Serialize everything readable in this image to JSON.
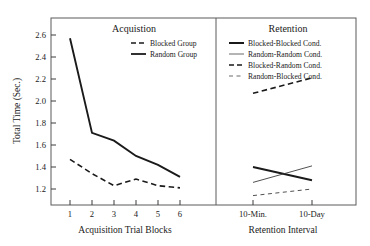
{
  "chart_data": {
    "type": "line",
    "title": "",
    "ylabel": "Total Time (Sec.)",
    "ylim": [
      1.1,
      2.7
    ],
    "ytick_labels": [
      "1.2",
      "1.4",
      "1.6",
      "1.8",
      "2.0",
      "2.2",
      "2.4",
      "2.6"
    ],
    "yticks": [
      1.2,
      1.4,
      1.6,
      1.8,
      2.0,
      2.2,
      2.4,
      2.6
    ],
    "grid": false,
    "legend_position": "top-right-of-each-panel",
    "panels": [
      {
        "name": "acquisition",
        "title": "Acquistion",
        "xlabel": "Acquisition Trial Blocks",
        "categories": [
          "1",
          "2",
          "3",
          "4",
          "5",
          "6"
        ],
        "x": [
          1,
          2,
          3,
          4,
          5,
          6
        ],
        "series": [
          {
            "name": "Blocked Group",
            "style": "dashed",
            "width": "thick",
            "color": "#1a1a1a",
            "values": [
              1.47,
              1.34,
              1.23,
              1.29,
              1.23,
              1.21
            ]
          },
          {
            "name": "Random Group",
            "style": "solid",
            "width": "thick",
            "color": "#1a1a1a",
            "values": [
              2.57,
              1.71,
              1.64,
              1.5,
              1.42,
              1.31
            ]
          }
        ]
      },
      {
        "name": "retention",
        "title": "Retention",
        "xlabel": "Retention Interval",
        "categories": [
          "10-Min.",
          "10-Day"
        ],
        "x": [
          1,
          2
        ],
        "series": [
          {
            "name": "Blocked-Blocked Cond.",
            "style": "solid",
            "width": "thick",
            "color": "#1a1a1a",
            "values": [
              1.4,
              1.28
            ]
          },
          {
            "name": "Random-Random Cond.",
            "style": "solid",
            "width": "thin",
            "color": "#3c3c3c",
            "values": [
              1.26,
              1.41
            ]
          },
          {
            "name": "Blocked-Random Cond.",
            "style": "dashed",
            "width": "thick",
            "color": "#1a1a1a",
            "values": [
              2.07,
              2.21
            ]
          },
          {
            "name": "Random-Blocked Cond.",
            "style": "dashed",
            "width": "thin",
            "color": "#3c3c3c",
            "values": [
              1.14,
              1.2
            ]
          }
        ]
      }
    ]
  },
  "axes": {
    "ylabel": "Total Time (Sec.)",
    "ytick_labels": [
      "1.2",
      "1.4",
      "1.6",
      "1.8",
      "2.0",
      "2.2",
      "2.4",
      "2.6"
    ],
    "left_xlabel": "Acquisition Trial Blocks",
    "left_xtick_labels": [
      "1",
      "2",
      "3",
      "4",
      "5",
      "6"
    ],
    "right_xlabel": "Retention Interval",
    "right_xtick_labels": [
      "10-Min.",
      "10-Day"
    ]
  },
  "left_panel": {
    "title": "Acquistion",
    "legend": [
      {
        "label": "Blocked Group"
      },
      {
        "label": "Random Group"
      }
    ]
  },
  "right_panel": {
    "title": "Retention",
    "legend": [
      {
        "label": "Blocked-Blocked Cond."
      },
      {
        "label": "Random-Random Cond."
      },
      {
        "label": "Blocked-Random Cond."
      },
      {
        "label": "Random-Blocked Cond."
      }
    ]
  }
}
